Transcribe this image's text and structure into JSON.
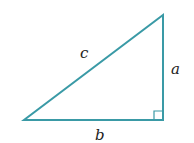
{
  "diagram": {
    "type": "right-triangle",
    "stroke_color": "#3a9aa6",
    "vertices": {
      "top": [
        163,
        15
      ],
      "right_angle": [
        163,
        120
      ],
      "left": [
        24,
        120
      ]
    },
    "right_angle_marker_size": 9,
    "labels": {
      "hypotenuse": "c",
      "vertical_leg": "a",
      "horizontal_leg": "b"
    }
  }
}
